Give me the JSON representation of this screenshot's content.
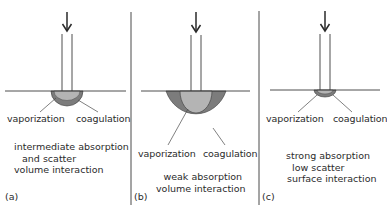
{
  "figure": {
    "panels": [
      {
        "id": "a",
        "letter": "(a)",
        "left_label": "vaporization",
        "right_label": "coagulation",
        "description": [
          "intermediate absorption",
          "and scatter",
          "volume interaction"
        ]
      },
      {
        "id": "b",
        "letter": "(b)",
        "left_label": "vaporization",
        "right_label": "coagulation",
        "description": [
          "weak absorption",
          "volume interaction"
        ]
      },
      {
        "id": "c",
        "letter": "(c)",
        "left_label": "vaporization",
        "right_label": "coagulation",
        "description": [
          "strong absorption",
          "low scatter",
          "surface interaction"
        ]
      }
    ],
    "colors": {
      "line": "#3a3a3a",
      "vaporization_zone": "#b4b4b4",
      "coagulation_zone": "#7c7c7c"
    },
    "icons": [
      "down-arrow-icon"
    ]
  }
}
